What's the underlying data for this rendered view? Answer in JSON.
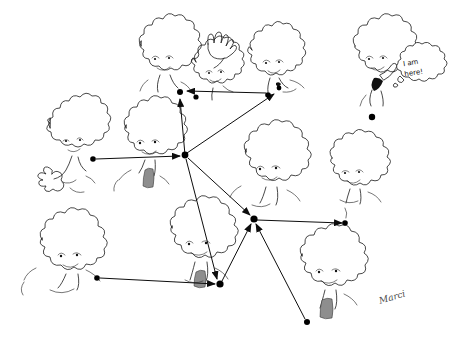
{
  "artwork": {
    "title": "I am here!",
    "medium": "pen-and-ink cartoon",
    "signature": "Marci",
    "background_color": "#ffffff",
    "ink_color": "#1a1a1a",
    "node_color": "#000000",
    "speech_bubble": {
      "line1": "I am",
      "line2": "here!",
      "full_text": "I am here!"
    }
  },
  "characters": [
    {
      "id": "tree-top-left",
      "label": "tree-face-waving",
      "x": 78,
      "y": 150,
      "scale": 1.0
    },
    {
      "id": "tree-top-center",
      "label": "tree-face-shaggy",
      "x": 163,
      "y": 62,
      "scale": 1.0
    },
    {
      "id": "tree-center-hand",
      "label": "tree-face-raised-hand",
      "x": 215,
      "y": 62,
      "scale": 1.0
    },
    {
      "id": "tree-top-right-pair",
      "label": "tree-face-pair",
      "x": 276,
      "y": 65,
      "scale": 1.0
    },
    {
      "id": "tree-center-left",
      "label": "tree-face-center",
      "x": 148,
      "y": 145,
      "scale": 1.0
    },
    {
      "id": "tree-center-right",
      "label": "tree-face-mid-right",
      "x": 268,
      "y": 175,
      "scale": 1.0
    },
    {
      "id": "tree-right",
      "label": "tree-face-right",
      "x": 352,
      "y": 180,
      "scale": 1.0
    },
    {
      "id": "tree-bottom-left",
      "label": "tree-face-bottom-left",
      "x": 68,
      "y": 262,
      "scale": 1.0
    },
    {
      "id": "tree-bottom-center",
      "label": "tree-face-bottom-center",
      "x": 196,
      "y": 250,
      "scale": 1.0
    },
    {
      "id": "tree-bottom-right",
      "label": "tree-face-bottom-right",
      "x": 325,
      "y": 278,
      "scale": 1.0
    },
    {
      "id": "tree-speaking",
      "label": "tree-face-speaking",
      "x": 378,
      "y": 58,
      "scale": 1.0
    }
  ],
  "graph": {
    "nodes": [
      {
        "id": "n1",
        "name": "node-top-center-left",
        "x": 180,
        "y": 92,
        "r": 3.0
      },
      {
        "id": "n2",
        "name": "node-top-center-right",
        "x": 196,
        "y": 97,
        "r": 2.6
      },
      {
        "id": "n3",
        "name": "node-top-right-a",
        "x": 268,
        "y": 95,
        "r": 2.8
      },
      {
        "id": "n4",
        "name": "node-top-right-b",
        "x": 279,
        "y": 88,
        "r": 2.4
      },
      {
        "id": "n5",
        "name": "node-hub-left",
        "x": 185,
        "y": 155,
        "r": 3.4
      },
      {
        "id": "n6",
        "name": "node-left-mid",
        "x": 93,
        "y": 159,
        "r": 2.8
      },
      {
        "id": "n7",
        "name": "node-hub-right",
        "x": 254,
        "y": 219,
        "r": 3.6
      },
      {
        "id": "n8",
        "name": "node-right-edge",
        "x": 345,
        "y": 223,
        "r": 2.8
      },
      {
        "id": "n9",
        "name": "node-bottom-left",
        "x": 97,
        "y": 278,
        "r": 2.8
      },
      {
        "id": "n10",
        "name": "node-bottom-center",
        "x": 220,
        "y": 284,
        "r": 3.6
      },
      {
        "id": "n11",
        "name": "node-bottom-right",
        "x": 307,
        "y": 322,
        "r": 3.0
      },
      {
        "id": "n12",
        "name": "node-isolated-speaker",
        "x": 372,
        "y": 117,
        "r": 3.2
      }
    ],
    "edges": [
      {
        "id": "e1",
        "name": "edge-hub-left-to-top",
        "from": "n5",
        "to": "n1",
        "arrow": true
      },
      {
        "id": "e2",
        "name": "edge-top-right-to-top-left",
        "from": "n3",
        "to": "n1",
        "arrow": true
      },
      {
        "id": "e3",
        "name": "edge-hub-left-to-top-right",
        "from": "n5",
        "to": "n3",
        "arrow": true
      },
      {
        "id": "e4",
        "name": "edge-left-mid-to-hub-left",
        "from": "n6",
        "to": "n5",
        "arrow": true
      },
      {
        "id": "e5",
        "name": "edge-hub-left-to-hub-right",
        "from": "n5",
        "to": "n7",
        "arrow": true
      },
      {
        "id": "e6",
        "name": "edge-hub-left-to-bottom-ctr",
        "from": "n5",
        "to": "n10",
        "arrow": true
      },
      {
        "id": "e7",
        "name": "edge-hub-right-to-right",
        "from": "n7",
        "to": "n8",
        "arrow": true
      },
      {
        "id": "e8",
        "name": "edge-bottom-ctr-to-hub-right",
        "from": "n10",
        "to": "n7",
        "arrow": true
      },
      {
        "id": "e9",
        "name": "edge-bottom-right-to-hub",
        "from": "n11",
        "to": "n7",
        "arrow": true
      },
      {
        "id": "e10",
        "name": "edge-bottom-left-to-center",
        "from": "n9",
        "to": "n10",
        "arrow": true
      }
    ]
  }
}
